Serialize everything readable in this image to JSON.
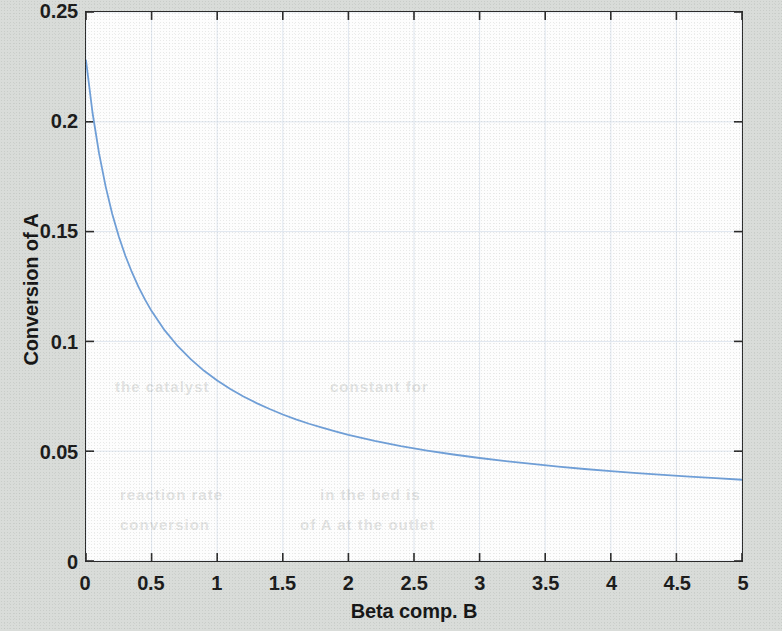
{
  "figure": {
    "background_color": "#d9dcd9",
    "plot_background_color": "#fdfdfd",
    "axis_color": "#2b2b2b",
    "grid_color": "#dfe6ef",
    "curve_color": "#6f9fd8"
  },
  "chart_data": {
    "type": "line",
    "title": "",
    "xlabel": "Beta comp. B",
    "ylabel": "Conversion of A",
    "xlim": [
      0,
      5
    ],
    "ylim": [
      0,
      0.25
    ],
    "grid": true,
    "legend": null,
    "xticks": [
      "0",
      "0.5",
      "1",
      "1.5",
      "2",
      "2.5",
      "3",
      "3.5",
      "4",
      "4.5",
      "5"
    ],
    "xtick_values": [
      0,
      0.5,
      1,
      1.5,
      2,
      2.5,
      3,
      3.5,
      4,
      4.5,
      5
    ],
    "yticks": [
      "0",
      "0.05",
      "0.1",
      "0.15",
      "0.2",
      "0.25"
    ],
    "ytick_values": [
      0,
      0.05,
      0.1,
      0.15,
      0.2,
      0.25
    ],
    "series": [
      {
        "name": "Conversion of A",
        "color": "#6f9fd8",
        "linewidth": 1.8,
        "x": [
          0,
          0.05,
          0.1,
          0.15,
          0.2,
          0.25,
          0.3,
          0.35,
          0.4,
          0.45,
          0.5,
          0.6,
          0.7,
          0.8,
          0.9,
          1.0,
          1.1,
          1.2,
          1.3,
          1.4,
          1.5,
          1.6,
          1.7,
          1.8,
          1.9,
          2.0,
          2.2,
          2.4,
          2.6,
          2.8,
          3.0,
          3.2,
          3.4,
          3.6,
          3.8,
          4.0,
          4.2,
          4.4,
          4.6,
          4.8,
          5.0
        ],
        "values": [
          0.228,
          0.204,
          0.1855,
          0.1705,
          0.158,
          0.1478,
          0.139,
          0.1315,
          0.1248,
          0.119,
          0.1138,
          0.105,
          0.0978,
          0.0918,
          0.0866,
          0.0822,
          0.0783,
          0.0749,
          0.0719,
          0.0692,
          0.0667,
          0.0645,
          0.0625,
          0.0607,
          0.059,
          0.0574,
          0.0547,
          0.0523,
          0.0503,
          0.0485,
          0.0469,
          0.0455,
          0.0442,
          0.043,
          0.0419,
          0.0409,
          0.04,
          0.0392,
          0.0384,
          0.0377,
          0.037
        ]
      }
    ]
  },
  "bleed_text": [
    {
      "text": "the catalyst",
      "x": 115,
      "y": 378
    },
    {
      "text": "constant for",
      "x": 330,
      "y": 378
    },
    {
      "text": "reaction rate",
      "x": 120,
      "y": 486
    },
    {
      "text": "in the bed is",
      "x": 320,
      "y": 486
    },
    {
      "text": "conversion",
      "x": 120,
      "y": 516
    },
    {
      "text": "of A at the outlet",
      "x": 300,
      "y": 516
    }
  ]
}
